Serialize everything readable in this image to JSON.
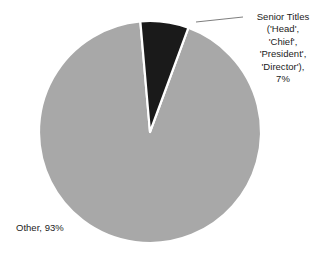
{
  "chart_data": {
    "type": "pie",
    "title": "",
    "subtitle": "",
    "xlabel": "",
    "ylabel": "",
    "legend_position": "none",
    "grid": false,
    "labels_outside": true,
    "start_angle_deg": -5,
    "direction": "clockwise",
    "categories": [
      "Senior Titles ('Head', 'Chief', 'President', 'Director')",
      "Other"
    ],
    "values": [
      7,
      93
    ],
    "value_unit": "percent",
    "colors": [
      "#1a1a1a",
      "#a8a8a8"
    ],
    "slice_edge_color": "#ffffff",
    "slices": [
      {
        "name": "Senior Titles ('Head', 'Chief', 'President', 'Director')",
        "value": 7,
        "display_percent": "7%",
        "color": "#1a1a1a",
        "label_lines": [
          "Senior Titles",
          "('Head',",
          "'Chief',",
          "'President',",
          "'Director'),",
          "7%"
        ],
        "has_leader_line": true
      },
      {
        "name": "Other",
        "value": 93,
        "display_percent": "93%",
        "color": "#a8a8a8",
        "label_lines": [
          "Other, 93%"
        ],
        "has_leader_line": false
      }
    ]
  },
  "labels": {
    "senior_titles": "Senior Titles\n('Head',\n'Chief',\n'President',\n'Director'),\n7%",
    "other": "Other, 93%"
  },
  "colors": {
    "dark_slice": "#1a1a1a",
    "gray_slice": "#a8a8a8",
    "background": "#ffffff",
    "text": "#1b1b1b",
    "leader_line": "#6f6f6f"
  }
}
